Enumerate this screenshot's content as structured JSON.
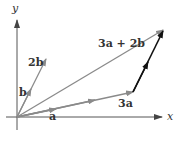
{
  "figure": {
    "axes": {
      "x_label": "x",
      "y_label": "y"
    },
    "vectors": [
      {
        "name": "a",
        "label": "a",
        "from": [
          0,
          0
        ],
        "to": "a",
        "color": "#8a8a8a"
      },
      {
        "name": "3a",
        "label": "3a",
        "from": [
          0,
          0
        ],
        "to": "3a",
        "color": "#8a8a8a"
      },
      {
        "name": "b",
        "label": "b",
        "from": [
          0,
          0
        ],
        "to": "b",
        "color": "#8a8a8a"
      },
      {
        "name": "2b",
        "label": "2b",
        "from": [
          0,
          0
        ],
        "to": "2b",
        "color": "#8a8a8a"
      },
      {
        "name": "3a+2b",
        "label": "3a + 2b",
        "from": [
          0,
          0
        ],
        "to": "3a+2b",
        "color": "#8a8a8a"
      },
      {
        "name": "2b-translated",
        "label": "",
        "from": "3a",
        "to": "3a+2b",
        "color": "#111111"
      }
    ],
    "labels": {
      "a": "a",
      "three_a": "3a",
      "b": "b",
      "two_b": "2b",
      "sum": "3a + 2b"
    },
    "colors": {
      "axis": "#555555",
      "vector": "#8a8a8a",
      "translated_vector": "#111111",
      "text": "#333333"
    }
  }
}
